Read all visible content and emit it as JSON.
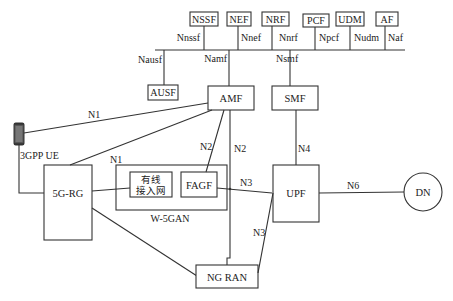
{
  "diagram": {
    "type": "5G wireline access network architecture (W-5GAN)",
    "top_nfs": [
      {
        "name": "NSSF",
        "interface": "Nnssf"
      },
      {
        "name": "NEF",
        "interface": "Nnef"
      },
      {
        "name": "NRF",
        "interface": "Nnrf"
      },
      {
        "name": "PCF",
        "interface": "Npcf"
      },
      {
        "name": "UDM",
        "interface": "Nudm"
      },
      {
        "name": "AF",
        "interface": "Naf"
      }
    ],
    "bus_nfs": [
      {
        "name": "AUSF",
        "interface": "Nausf"
      },
      {
        "name": "AMF",
        "interface": "Namf"
      },
      {
        "name": "SMF",
        "interface": "Nsmf"
      }
    ],
    "nodes": {
      "ue": "3GPP UE",
      "rg": "5G-RG",
      "wired_an_line1": "有线",
      "wired_an_line2": "接入网",
      "fagf": "FAGF",
      "w5gan": "W-5GAN",
      "upf": "UPF",
      "dn": "DN",
      "ngran": "NG RAN"
    },
    "links": {
      "ue_amf": "N1",
      "rg_amf": "N1",
      "fagf_amf": "N2",
      "ngran_amf": "N2",
      "smf_upf": "N4",
      "fagf_upf": "N3",
      "ngran_upf": "N3",
      "upf_dn": "N6"
    }
  }
}
